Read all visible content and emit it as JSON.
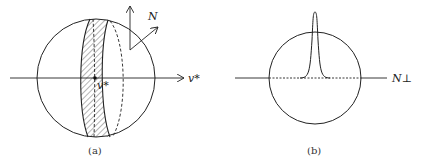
{
  "panel_a": {
    "caption": "(a)",
    "axis_label": "v*",
    "point_label": "v*",
    "normal_label": "N"
  },
  "panel_b": {
    "caption": "(b)",
    "axis_label": "N⊥"
  }
}
